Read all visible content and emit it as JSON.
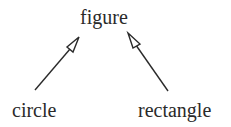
{
  "diagram": {
    "type": "class-inheritance",
    "nodes": [
      {
        "id": "figure",
        "label": "figure"
      },
      {
        "id": "circle",
        "label": "circle"
      },
      {
        "id": "rectangle",
        "label": "rectangle"
      }
    ],
    "edges": [
      {
        "from": "circle",
        "to": "figure",
        "arrowhead": "hollow-triangle"
      },
      {
        "from": "rectangle",
        "to": "figure",
        "arrowhead": "hollow-triangle"
      }
    ],
    "colors": {
      "text": "#2a2a2a",
      "line": "#2a2a2a",
      "background": "#ffffff"
    }
  }
}
